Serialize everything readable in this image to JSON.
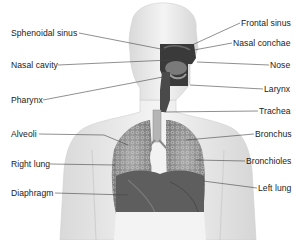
{
  "diagram": {
    "labels_left": [
      {
        "id": "sphenoidal-sinus",
        "text": "Sphenoidal sinus",
        "x": 11,
        "y": 28
      },
      {
        "id": "nasal-cavity",
        "text": "Nasal cavity",
        "x": 11,
        "y": 60
      },
      {
        "id": "pharynx",
        "text": "Pharynx",
        "x": 11,
        "y": 95
      },
      {
        "id": "alveoli",
        "text": "Alveoli",
        "x": 11,
        "y": 130
      },
      {
        "id": "right-lung",
        "text": "Right lung",
        "x": 11,
        "y": 159
      },
      {
        "id": "diaphragm",
        "text": "Diaphragm",
        "x": 11,
        "y": 188
      }
    ],
    "labels_right": [
      {
        "id": "frontal-sinus",
        "text": "Frontal sinus",
        "x": 241,
        "y": 18
      },
      {
        "id": "nasal-conchae",
        "text": "Nasal conchae",
        "x": 233,
        "y": 39
      },
      {
        "id": "nose",
        "text": "Nose",
        "x": 270,
        "y": 61
      },
      {
        "id": "larynx",
        "text": "Larynx",
        "x": 264,
        "y": 85
      },
      {
        "id": "trachea",
        "text": "Trachea",
        "x": 259,
        "y": 107
      },
      {
        "id": "bronchus",
        "text": "Bronchus",
        "x": 255,
        "y": 130
      },
      {
        "id": "bronchioles",
        "text": "Bronchioles",
        "x": 246,
        "y": 157
      },
      {
        "id": "left-lung",
        "text": "Left lung",
        "x": 258,
        "y": 184
      }
    ],
    "colors": {
      "background": "#ffffff",
      "body": "#ececec",
      "body_edge": "#cfcfcf",
      "airway_dark": "#3a3a3a",
      "lung": "#8a8a8a",
      "lung_dark": "#5a5a5a",
      "leader_line": "#444444",
      "text": "#222222"
    }
  }
}
